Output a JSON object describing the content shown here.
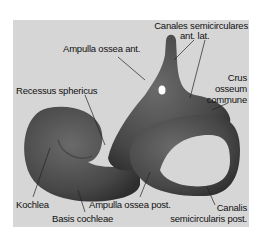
{
  "figure": {
    "background": "#d6d6d6",
    "structure_color": "#444444",
    "labels": {
      "canales_line1": "Canales semicirculares",
      "canales_line2": "ant. lat.",
      "ampulla_ant": "Ampulla ossea ant.",
      "crus_line1": "Crus",
      "crus_line2": "osseum",
      "crus_line3": "commune",
      "recessus": "Recessus sphericus",
      "kochlea": "Kochlea",
      "basis": "Basis cochleae",
      "ampulla_post": "Ampulla ossea post.",
      "canalis_line1": "Canalis",
      "canalis_line2": "semicircularis post."
    }
  }
}
